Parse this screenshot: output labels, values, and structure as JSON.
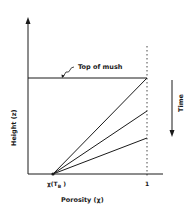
{
  "diagram": {
    "annotation_top": "Top of mush",
    "y_axis_label": "Height (z)",
    "x_axis_label": "Porosity (χ)",
    "x_tick_left": "χ(T",
    "x_tick_left_sub": "B",
    "x_tick_left_close": ")",
    "x_tick_right": "1",
    "time_label": "Time",
    "colors": {
      "ink": "#1a1a1a",
      "background": "#ffffff"
    },
    "lines": [
      {
        "name": "profile-1",
        "from": [
          53,
          174
        ],
        "to": [
          147,
          78
        ]
      },
      {
        "name": "profile-2",
        "from": [
          53,
          174
        ],
        "to": [
          147,
          111
        ]
      },
      {
        "name": "profile-3",
        "from": [
          53,
          174
        ],
        "to": [
          147,
          138
        ]
      }
    ]
  }
}
